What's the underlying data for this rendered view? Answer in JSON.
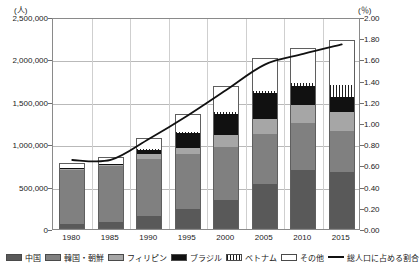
{
  "chart_data": {
    "type": "bar",
    "title": "",
    "subtitle": "",
    "xlabel": "",
    "ylabel": "(人)",
    "y2label": "(％)",
    "categories": [
      "1980",
      "1985",
      "1990",
      "1995",
      "2000",
      "2005",
      "2010",
      "2015"
    ],
    "ylim": [
      0,
      2500000
    ],
    "ytick_labels": [
      "0",
      "500,000",
      "1,000,000",
      "1,500,000",
      "2,000,000",
      "2,500,000"
    ],
    "ytick_values": [
      0,
      500000,
      1000000,
      1500000,
      2000000,
      2500000
    ],
    "y2lim": [
      0,
      2.0
    ],
    "y2tick_labels": [
      "0.00",
      "0.20",
      "0.40",
      "0.60",
      "0.80",
      "1.00",
      "1.20",
      "1.40",
      "1.60",
      "1.80",
      "2.00"
    ],
    "y2tick_values": [
      0,
      0.2,
      0.4,
      0.6,
      0.8,
      1.0,
      1.2,
      1.4,
      1.6,
      1.8,
      2.0
    ],
    "grid": true,
    "legend_position": "bottom",
    "stacked": true,
    "series": [
      {
        "name": "中国",
        "key": "china",
        "color": "#595959",
        "values": [
          52000,
          74000,
          150000,
          223000,
          336000,
          520000,
          687000,
          666000
        ]
      },
      {
        "name": "韓国・朝鮮",
        "key": "korea",
        "color": "#808080",
        "values": [
          665000,
          684000,
          688000,
          666000,
          635000,
          598000,
          566000,
          491000
        ]
      },
      {
        "name": "フィリピン",
        "key": "phil",
        "color": "#a6a6a6",
        "values": [
          6000,
          12000,
          49000,
          74000,
          144000,
          187000,
          210000,
          229000
        ]
      },
      {
        "name": "ブラジル",
        "key": "brazil",
        "color": "#111111",
        "values": [
          1500,
          2000,
          56000,
          176000,
          254000,
          302000,
          230000,
          174000
        ]
      },
      {
        "name": "ベトナム",
        "key": "vietnam",
        "color": "#1d1d1d",
        "values": [
          1000,
          4000,
          6000,
          9000,
          17000,
          29000,
          41000,
          147000
        ]
      },
      {
        "name": "その他",
        "key": "other",
        "color": "#ffffff",
        "values": [
          56500,
          74000,
          126000,
          214000,
          300000,
          375000,
          400000,
          525000
        ]
      }
    ],
    "line_series": {
      "name": "総人口に占める割合",
      "color": "#111111",
      "axis": "right",
      "unit": "%",
      "values": [
        0.67,
        0.67,
        0.87,
        1.09,
        1.33,
        1.57,
        1.67,
        1.76
      ]
    },
    "totals": [
      782000,
      850000,
      1075000,
      1362000,
      1686000,
      2011000,
      2134000,
      2232000
    ]
  },
  "legend": {
    "items": [
      {
        "label": "中国",
        "swatch": "china"
      },
      {
        "label": "韓国・朝鮮",
        "swatch": "korea"
      },
      {
        "label": "フィリピン",
        "swatch": "phil"
      },
      {
        "label": "ブラジル",
        "swatch": "brazil"
      },
      {
        "label": "ベトナム",
        "swatch": "vietnam"
      },
      {
        "label": "その他",
        "swatch": "other"
      },
      {
        "label": "総人口に占める割合",
        "swatch": "line"
      }
    ]
  }
}
